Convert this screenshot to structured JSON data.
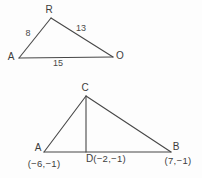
{
  "colors": {
    "background": "#fdfdfd",
    "line": "#474747",
    "text": "#3c3c3c"
  },
  "figure1": {
    "description": "triangle ARO with labeled side lengths",
    "vertex_top": "R",
    "vertex_left": "A",
    "vertex_right": "O",
    "side_left_length": "8",
    "side_right_length": "13",
    "side_bottom_length": "15"
  },
  "figure2": {
    "description": "triangle ACB with altitude from C to D on AB",
    "vertex_top": "C",
    "vertex_left": "A",
    "vertex_right": "B",
    "foot_label": "D",
    "coord_left": "(−6,−1)",
    "coord_foot": "(−2,−1)",
    "coord_right": "(7,−1)"
  }
}
